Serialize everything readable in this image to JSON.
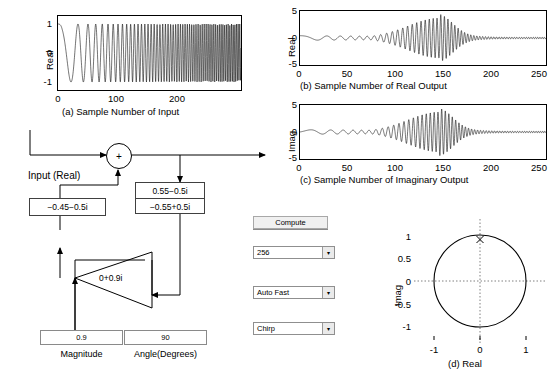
{
  "app": {
    "title": "Complex IIR Filter Demo"
  },
  "charts": {
    "a": {
      "panel_id": "(a)",
      "caption": "(a) Sample Number of Input",
      "ylabel": "Real",
      "yticks": [
        "1",
        "0",
        "-1"
      ],
      "ytickvals": [
        1,
        0,
        -1
      ],
      "xticks": [
        "0",
        "100",
        "200"
      ],
      "xtickvals": [
        0,
        100,
        200
      ],
      "xlim": [
        0,
        256
      ],
      "ylim": [
        -1.25,
        1.25
      ]
    },
    "b": {
      "panel_id": "(b)",
      "caption": "(b) Sample Number of Real Output",
      "ylabel": "Real",
      "yticks": [
        "5",
        "0",
        "-5"
      ],
      "ytickvals": [
        5,
        0,
        -5
      ],
      "xticks": [
        "0",
        "50",
        "100",
        "150",
        "200",
        "250"
      ],
      "xtickvals": [
        0,
        50,
        100,
        150,
        200,
        250
      ],
      "xlim": [
        0,
        256
      ],
      "ylim": [
        -6,
        6
      ]
    },
    "c": {
      "panel_id": "(c)",
      "caption": "(c) Sample Number of Imaginary Output",
      "ylabel": "Imag",
      "yticks": [
        "5",
        "0",
        "-5"
      ],
      "ytickvals": [
        5,
        0,
        -5
      ],
      "xticks": [
        "0",
        "50",
        "100",
        "150",
        "200",
        "250"
      ],
      "xtickvals": [
        0,
        50,
        100,
        150,
        200,
        250
      ],
      "xlim": [
        0,
        256
      ],
      "ylim": [
        -6,
        6
      ]
    },
    "d": {
      "panel_id": "(d)",
      "caption": "(d) Real",
      "ylabel": "Imag",
      "yticks": [
        "1",
        "0.5",
        "0",
        "-0.5",
        "-1"
      ],
      "ytickvals": [
        1,
        0.5,
        0,
        -0.5,
        -1
      ],
      "xticks": [
        "-1",
        "0",
        "1"
      ],
      "xtickvals": [
        -1,
        0,
        1
      ],
      "xlim": [
        -1.45,
        1.45
      ],
      "ylim": [
        -1.3,
        1.3
      ],
      "marker": "x",
      "marker_point": [
        0,
        0.9
      ],
      "unit_circle_radius": 1
    }
  },
  "chart_data": [
    {
      "type": "line",
      "id": "a",
      "title": "",
      "xlabel": "(a) Sample Number of Input",
      "ylabel": "Real",
      "xlim": [
        0,
        256
      ],
      "ylim": [
        -1.25,
        1.25
      ],
      "xticks": [
        0,
        100,
        200
      ],
      "yticks": [
        -1,
        0,
        1
      ],
      "grid": false,
      "description": "Real-valued linear chirp input, unit amplitude, frequency sweeping from low to high across 256 samples",
      "signal": "chirp",
      "amplitude": 1,
      "n_samples": 256
    },
    {
      "type": "line",
      "id": "b",
      "title": "",
      "xlabel": "(b) Sample Number of Real Output",
      "ylabel": "Real",
      "xlim": [
        0,
        256
      ],
      "ylim": [
        -6,
        6
      ],
      "xticks": [
        0,
        50,
        100,
        150,
        200,
        250
      ],
      "yticks": [
        -5,
        0,
        5
      ],
      "grid": false,
      "description": "Real part of complex resonator output; envelope peaks near sample 145 reaching about +/-5, then decays",
      "peak_sample": 145,
      "peak_amplitude": 5,
      "n_samples": 256
    },
    {
      "type": "line",
      "id": "c",
      "title": "",
      "xlabel": "(c) Sample Number of Imaginary Output",
      "ylabel": "Imag",
      "xlim": [
        0,
        256
      ],
      "ylim": [
        -6,
        6
      ],
      "xticks": [
        0,
        50,
        100,
        150,
        200,
        250
      ],
      "yticks": [
        -5,
        0,
        5
      ],
      "grid": false,
      "description": "Imaginary part of complex resonator output; envelope peaks near sample 145 reaching about +/-5, then decays",
      "peak_sample": 145,
      "peak_amplitude": 5,
      "n_samples": 256
    },
    {
      "type": "scatter",
      "id": "d",
      "title": "",
      "xlabel": "(d) Real",
      "ylabel": "Imag",
      "xlim": [
        -1.45,
        1.45
      ],
      "ylim": [
        -1.3,
        1.3
      ],
      "xticks": [
        -1,
        0,
        1
      ],
      "yticks": [
        -1,
        -0.5,
        0,
        0.5,
        1
      ],
      "grid": false,
      "description": "Z-plane pole-zero style plot: unit circle with a single pole marked x at 0 + 0.9i",
      "unit_circle": true,
      "points": [
        {
          "x": 0,
          "y": 0.9,
          "marker": "x"
        }
      ]
    }
  ],
  "diagram": {
    "input_label": "Input (Real)",
    "adder_symbol": "+",
    "feedback_box": {
      "top": "0.55−0.5i",
      "bottom": "−0.55+0.5i"
    },
    "left_coefficient": "−0.45−0.5i",
    "gain_label": "0+0.9i"
  },
  "controls": {
    "compute_button": "Compute",
    "length_select": {
      "value": "256",
      "arrow": "▾"
    },
    "speed_select": {
      "value": "Auto Fast",
      "arrow": "▾"
    },
    "signal_select": {
      "value": "Chirp",
      "arrow": "▾"
    },
    "magnitude_field": {
      "value": "0.9",
      "label": "Magnitude"
    },
    "angle_field": {
      "value": "90",
      "label": "Angle(Degrees)"
    }
  }
}
